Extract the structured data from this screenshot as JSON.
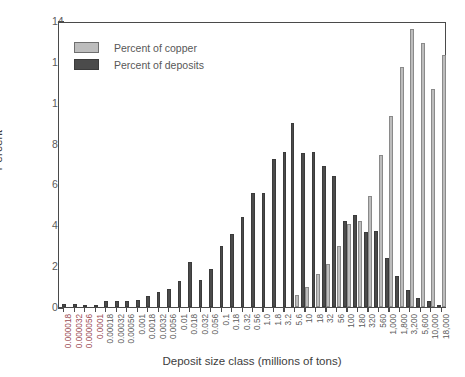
{
  "chart_data": {
    "type": "bar",
    "title": "",
    "xlabel": "Deposit size class (millions of tons)",
    "ylabel": "Percent",
    "ylim": [
      0,
      14
    ],
    "yticks": [
      0,
      2,
      4,
      6,
      8,
      10,
      12,
      14
    ],
    "ytick_labels": [
      "0",
      "2",
      "4",
      "6",
      "8",
      "10",
      "12",
      "14"
    ],
    "grid": false,
    "legend_position": "upper-left-inside",
    "categories": [
      "0.000018",
      "0.000032",
      "0.000056",
      "0.0001",
      "0.00018",
      "0.00032",
      "0.00056",
      "0.001",
      "0.0018",
      "0.0032",
      "0.0056",
      "0.01",
      "0.018",
      "0.032",
      "0.056",
      "0.1",
      "0.18",
      "0.32",
      "0.56",
      "1.0",
      "1.8",
      "3.2",
      "5.6",
      "10",
      "18",
      "32",
      "56",
      "100",
      "180",
      "320",
      "560",
      "1,000",
      "1,800",
      "3,200",
      "5,600",
      "10,000",
      "18,000"
    ],
    "red_tick_labels": [
      "0.000018",
      "0.000032",
      "0.000056",
      "0.0001"
    ],
    "series": [
      {
        "name": "Percent of deposits",
        "color": "#4b4b4b",
        "values": [
          0.15,
          0.15,
          0.12,
          0.05,
          0.3,
          0.3,
          0.3,
          0.35,
          0.55,
          0.75,
          0.9,
          1.25,
          2.2,
          1.3,
          1.85,
          3.0,
          3.55,
          4.4,
          5.6,
          5.6,
          7.25,
          7.6,
          9.0,
          7.55,
          7.6,
          6.9,
          6.4,
          4.2,
          4.5,
          3.65,
          3.7,
          2.4,
          1.5,
          0.85,
          0.45,
          0.3,
          0.12
        ]
      },
      {
        "name": "Percent of copper",
        "color": "#bdbdbd",
        "values": [
          0,
          0,
          0,
          0,
          0,
          0,
          0,
          0,
          0,
          0,
          0,
          0,
          0,
          0,
          0,
          0,
          0,
          0,
          0,
          0,
          0,
          0,
          0.6,
          1.0,
          1.6,
          2.1,
          3.0,
          4.05,
          4.2,
          5.45,
          7.45,
          9.35,
          11.75,
          13.6,
          12.9,
          10.65,
          12.35
        ]
      }
    ],
    "notes": {
      "extra_copper_right": [
        5.6,
        10.2
      ]
    }
  },
  "legend": {
    "items": [
      {
        "label": "Percent of copper",
        "swatch": "copper-swatch"
      },
      {
        "label": "Percent of deposits",
        "swatch": "deposits-swatch"
      }
    ]
  },
  "axes": {
    "y_title": "Percent",
    "x_title": "Deposit size class (millions of tons)"
  },
  "colors": {
    "copper": "#bdbdbd",
    "deposits": "#4b4b4b",
    "axis": "#4a4a4a",
    "tick_text": "#5a5a5a",
    "red_tick_text": "#9a4a52",
    "background": "#ffffff"
  }
}
